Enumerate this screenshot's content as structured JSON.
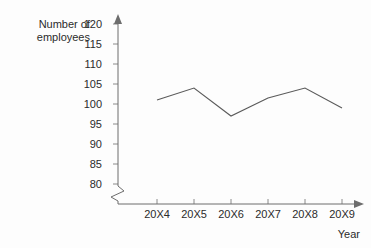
{
  "chart_data": {
    "type": "line",
    "title": "",
    "xlabel": "Year",
    "ylabel": "Number of employees",
    "categories": [
      "20X4",
      "20X5",
      "20X6",
      "20X7",
      "20X8",
      "20X9"
    ],
    "values": [
      101,
      104,
      97,
      101.5,
      104,
      99
    ],
    "series": [
      {
        "name": "Number of employees",
        "values": [
          101,
          104,
          97,
          101.5,
          104,
          99
        ]
      }
    ],
    "yticks": [
      80,
      85,
      90,
      95,
      100,
      105,
      110,
      115,
      120
    ],
    "ylim": [
      80,
      120
    ],
    "axis_break": true,
    "grid": false,
    "legend": false,
    "line_color": "#5a5a5a",
    "axis_color": "#6d6d6d",
    "background_color": "#fdfdfd"
  },
  "labels": {
    "y_axis_title_line1": "Number of",
    "y_axis_title_line2": "employees",
    "x_axis_title": "Year"
  }
}
